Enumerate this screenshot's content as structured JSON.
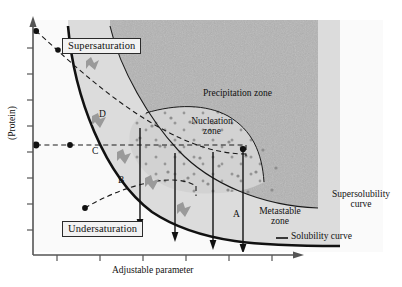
{
  "figure": {
    "type": "protein-crystallization-phase-diagram",
    "axes": {
      "x_label": "Adjustable parameter",
      "y_label": "(Protein)",
      "x_ticks": 6,
      "y_ticks": 8
    },
    "zone_labels": {
      "supersaturation": "Supersaturation",
      "undersaturation": "Undersaturation",
      "precipitation": "Precipitation zone",
      "nucleation_line1": "Nucleation",
      "nucleation_line2": "zone",
      "metastable_line1": "Metastable",
      "metastable_line2": "zone"
    },
    "curve_labels": {
      "supersolubility_line1": "Supersolubility",
      "supersolubility_line2": "curve",
      "solubility": "Solubility curve"
    },
    "trajectories": [
      {
        "id": "A"
      },
      {
        "id": "B"
      },
      {
        "id": "C"
      },
      {
        "id": "D"
      }
    ],
    "colors": {
      "precipitation_fill": "#b2b2b2",
      "nucleation_fill": "#d2d2d2",
      "metastable_fill": "#d8d8d8",
      "undersaturation_fill": "#f7f7f7",
      "curve_stroke": "#1a1a1a",
      "axis_stroke": "#555555",
      "crystal_fill": "#9a9a9a",
      "dot_fill": "#8d8d8d"
    }
  }
}
